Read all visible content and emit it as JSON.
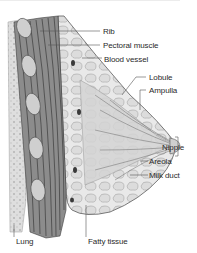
{
  "diagram": {
    "type": "anatomical-cross-section",
    "colors": {
      "background": "#ffffff",
      "ink": "#2a2a2a",
      "tissue": "#c8c8c8",
      "muscle": "#6e6e6e",
      "leader": "#555555"
    },
    "labels": [
      {
        "id": "rib",
        "text": "Rib"
      },
      {
        "id": "pectoral-muscle",
        "text": "Pectoral muscle"
      },
      {
        "id": "blood-vessel",
        "text": "Blood vessel"
      },
      {
        "id": "lobule",
        "text": "Lobule"
      },
      {
        "id": "ampulla",
        "text": "Ampulla"
      },
      {
        "id": "nipple",
        "text": "Nipple"
      },
      {
        "id": "areola",
        "text": "Areola"
      },
      {
        "id": "milk-duct",
        "text": "Milk duct"
      },
      {
        "id": "lung",
        "text": "Lung"
      },
      {
        "id": "fatty-tissue",
        "text": "Fatty tissue"
      }
    ]
  }
}
